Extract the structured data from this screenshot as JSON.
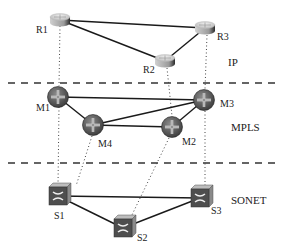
{
  "diagram": {
    "layers": [
      {
        "id": "ip",
        "label": "IP"
      },
      {
        "id": "mpls",
        "label": "MPLS"
      },
      {
        "id": "sonet",
        "label": "SONET"
      }
    ],
    "nodes": {
      "R1": {
        "label": "R1",
        "type": "ip-router",
        "layer": "ip"
      },
      "R2": {
        "label": "R2",
        "type": "ip-router",
        "layer": "ip"
      },
      "R3": {
        "label": "R3",
        "type": "ip-router",
        "layer": "ip"
      },
      "M1": {
        "label": "M1",
        "type": "mpls-router",
        "layer": "mpls"
      },
      "M2": {
        "label": "M2",
        "type": "mpls-router",
        "layer": "mpls"
      },
      "M3": {
        "label": "M3",
        "type": "mpls-router",
        "layer": "mpls"
      },
      "M4": {
        "label": "M4",
        "type": "mpls-router",
        "layer": "mpls"
      },
      "S1": {
        "label": "S1",
        "type": "sonet-switch",
        "layer": "sonet"
      },
      "S2": {
        "label": "S2",
        "type": "sonet-switch",
        "layer": "sonet"
      },
      "S3": {
        "label": "S3",
        "type": "sonet-switch",
        "layer": "sonet"
      }
    },
    "links": [
      [
        "R1",
        "R3"
      ],
      [
        "R1",
        "R2"
      ],
      [
        "R2",
        "R3"
      ],
      [
        "M1",
        "M3"
      ],
      [
        "M1",
        "M4"
      ],
      [
        "M4",
        "M3"
      ],
      [
        "M4",
        "M2"
      ],
      [
        "M2",
        "M3"
      ],
      [
        "S1",
        "S3"
      ],
      [
        "S1",
        "S2"
      ],
      [
        "S2",
        "S3"
      ]
    ],
    "cross_layer_mappings": [
      [
        "R1",
        "M1"
      ],
      [
        "R2",
        "M2"
      ],
      [
        "R3",
        "M3"
      ],
      [
        "M1",
        "S1"
      ],
      [
        "M4",
        "S1"
      ],
      [
        "M2",
        "S2"
      ],
      [
        "M3",
        "S3"
      ]
    ]
  }
}
